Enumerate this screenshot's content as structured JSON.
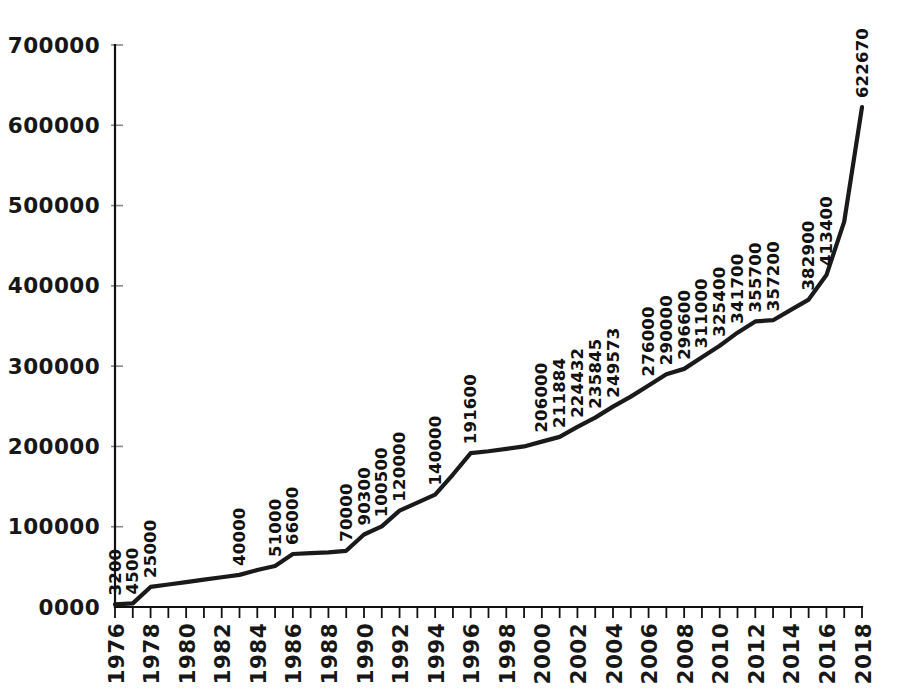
{
  "chart_data": {
    "type": "line",
    "title": "",
    "subtitle": "",
    "xlabel": "",
    "ylabel": "",
    "grid": false,
    "legend": "none",
    "legend_position": "none",
    "line_color": "#1a1a1a",
    "axis_color": "#111111",
    "background": "#ffffff",
    "xlim": [
      1976,
      2018
    ],
    "ylim": [
      0,
      700000
    ],
    "ytick_values": [
      0,
      100000,
      200000,
      300000,
      400000,
      500000,
      600000,
      700000
    ],
    "ytick_labels": [
      "0000",
      "100000",
      "200000",
      "300000",
      "400000",
      "500000",
      "600000",
      "700000"
    ],
    "xtick_values": [
      1976,
      1977,
      1978,
      1979,
      1980,
      1981,
      1982,
      1983,
      1984,
      1985,
      1986,
      1987,
      1988,
      1989,
      1990,
      1991,
      1992,
      1993,
      1994,
      1995,
      1996,
      1997,
      1998,
      1999,
      2000,
      2001,
      2002,
      2003,
      2004,
      2005,
      2006,
      2007,
      2008,
      2009,
      2010,
      2011,
      2012,
      2013,
      2014,
      2015,
      2016,
      2017,
      2018
    ],
    "xtick_labels_shown": [
      "1976",
      "1978",
      "1980",
      "1982",
      "1984",
      "1986",
      "1988",
      "1990",
      "1992",
      "1994",
      "1996",
      "1998",
      "2000",
      "2002",
      "2004",
      "2006",
      "2008",
      "2010",
      "2012",
      "2014",
      "2016",
      "2018"
    ],
    "x": [
      1976,
      1977,
      1978,
      1979,
      1980,
      1981,
      1982,
      1983,
      1984,
      1985,
      1986,
      1987,
      1988,
      1989,
      1990,
      1991,
      1992,
      1993,
      1994,
      1995,
      1996,
      1997,
      1998,
      1999,
      2000,
      2001,
      2002,
      2003,
      2004,
      2005,
      2006,
      2007,
      2008,
      2009,
      2010,
      2011,
      2012,
      2013,
      2014,
      2015,
      2016,
      2017,
      2018
    ],
    "values": [
      3200,
      4500,
      25000,
      28000,
      31000,
      34000,
      37000,
      40000,
      46000,
      51000,
      66000,
      67000,
      68000,
      70000,
      90300,
      100500,
      120000,
      130000,
      140000,
      165000,
      191600,
      194000,
      197000,
      200000,
      206000,
      211884,
      224432,
      235845,
      249573,
      262000,
      276000,
      290000,
      296600,
      311000,
      325400,
      341700,
      355700,
      357200,
      370000,
      382900,
      413400,
      480000,
      622670
    ],
    "point_labels": [
      {
        "x": 1976,
        "value": 3200,
        "text": "3200"
      },
      {
        "x": 1977,
        "value": 4500,
        "text": "4500"
      },
      {
        "x": 1978,
        "value": 25000,
        "text": "25000"
      },
      {
        "x": 1983,
        "value": 40000,
        "text": "40000"
      },
      {
        "x": 1985,
        "value": 51000,
        "text": "51000"
      },
      {
        "x": 1986,
        "value": 66000,
        "text": "66000"
      },
      {
        "x": 1989,
        "value": 70000,
        "text": "70000"
      },
      {
        "x": 1990,
        "value": 90300,
        "text": "90300"
      },
      {
        "x": 1991,
        "value": 100500,
        "text": "100500"
      },
      {
        "x": 1992,
        "value": 120000,
        "text": "120000"
      },
      {
        "x": 1994,
        "value": 140000,
        "text": "140000"
      },
      {
        "x": 1996,
        "value": 191600,
        "text": "191600"
      },
      {
        "x": 2000,
        "value": 206000,
        "text": "206000"
      },
      {
        "x": 2001,
        "value": 211884,
        "text": "211884"
      },
      {
        "x": 2002,
        "value": 224432,
        "text": "224432"
      },
      {
        "x": 2003,
        "value": 235845,
        "text": "235845"
      },
      {
        "x": 2004,
        "value": 249573,
        "text": "249573"
      },
      {
        "x": 2006,
        "value": 276000,
        "text": "276000"
      },
      {
        "x": 2007,
        "value": 290000,
        "text": "290000"
      },
      {
        "x": 2008,
        "value": 296600,
        "text": "296600"
      },
      {
        "x": 2009,
        "value": 311000,
        "text": "311000"
      },
      {
        "x": 2010,
        "value": 325400,
        "text": "325400"
      },
      {
        "x": 2011,
        "value": 341700,
        "text": "341700"
      },
      {
        "x": 2012,
        "value": 355700,
        "text": "355700"
      },
      {
        "x": 2013,
        "value": 357200,
        "text": "357200"
      },
      {
        "x": 2015,
        "value": 382900,
        "text": "382900"
      },
      {
        "x": 2016,
        "value": 413400,
        "text": "413400"
      },
      {
        "x": 2018,
        "value": 622670,
        "text": "622670"
      }
    ]
  }
}
